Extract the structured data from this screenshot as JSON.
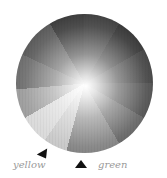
{
  "wheel": {
    "description": "grayscale color wheel with radial segments and bright center",
    "segment_count": 12
  },
  "labels": {
    "yellow": "yellow",
    "green": "green"
  },
  "pointers": [
    {
      "name": "yellow-pointer",
      "color": "#111111"
    },
    {
      "name": "green-pointer",
      "color": "#111111"
    }
  ]
}
